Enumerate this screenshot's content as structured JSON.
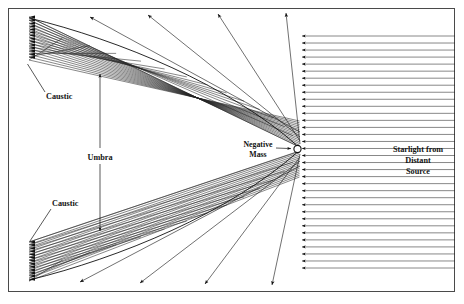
{
  "figure": {
    "background_color": "#ffffff",
    "frame": {
      "name": "outer-border",
      "x": 8,
      "y": 8,
      "width": 447,
      "height": 284,
      "stroke": "#4a4a4a",
      "stroke_width": 1
    },
    "ray_color": "#1e1e1e",
    "accent_color": "#000000"
  },
  "labels": {
    "caustic_top": "Caustic",
    "caustic_bottom": "Caustic",
    "umbra": "Umbra",
    "negative_mass_line1": "Negative",
    "negative_mass_line2": "Mass",
    "starlight_line1": "Starlight from",
    "starlight_line2": "Distant",
    "starlight_line3": "Source"
  },
  "chart_data": {
    "type": "line",
    "xlabel": "",
    "ylabel": "",
    "xlim": [
      8,
      455
    ],
    "ylim": [
      8,
      292
    ],
    "grid": false,
    "legend": "none",
    "lens": {
      "name": "negative-mass-point",
      "cx": 297.5,
      "cy": 149,
      "r": 3.6,
      "fill": "#ffffff",
      "stroke": "#111111"
    },
    "incoming_rays": {
      "name": "starlight-beam",
      "direction": "right-to-left",
      "x_start": 455,
      "x_arrowhead": 299,
      "y_min": 36,
      "y_max": 268,
      "count": 34,
      "spacing": 7.03
    },
    "deflected_fan_top": {
      "name": "upper-deflected-fan",
      "converge_x": 29,
      "converge_y_min": 17,
      "converge_y_max": 60,
      "origin_x": 297,
      "origin_y": 149,
      "count": 16
    },
    "deflected_fan_bottom": {
      "name": "lower-deflected-fan",
      "converge_x": 29,
      "converge_y_min": 242,
      "converge_y_max": 281,
      "origin_x": 297,
      "origin_y": 149,
      "count": 16
    },
    "escaping_rays_top": [
      {
        "x1": 300,
        "y1": 132,
        "x2": 90,
        "y2": 17
      },
      {
        "x1": 300,
        "y1": 137,
        "x2": 148,
        "y2": 15
      },
      {
        "x1": 300,
        "y1": 141,
        "x2": 218,
        "y2": 14
      },
      {
        "x1": 300,
        "y1": 144,
        "x2": 286,
        "y2": 13
      }
    ],
    "escaping_rays_bottom": [
      {
        "x1": 300,
        "y1": 166,
        "x2": 80,
        "y2": 282
      },
      {
        "x1": 300,
        "y1": 161,
        "x2": 140,
        "y2": 283
      },
      {
        "x1": 300,
        "y1": 157,
        "x2": 205,
        "y2": 284
      },
      {
        "x1": 300,
        "y1": 154,
        "x2": 272,
        "y2": 285
      }
    ],
    "annotations": [
      {
        "text": "Caustic",
        "x": 46,
        "y": 99,
        "leader_to_x": 27,
        "leader_to_y": 64
      },
      {
        "text": "Caustic",
        "x": 52,
        "y": 206,
        "leader_to_x": 30,
        "leader_to_y": 240
      },
      {
        "text": "Umbra",
        "x": 100,
        "y": 160,
        "arrow_up_to_y": 72,
        "arrow_down_to_y": 232
      },
      {
        "text": "Negative Mass",
        "x": 258,
        "y": 149,
        "arrow_to_x": 292,
        "arrow_to_y": 149
      },
      {
        "text": "Starlight from Distant Source",
        "x": 418,
        "y": 152
      }
    ]
  }
}
